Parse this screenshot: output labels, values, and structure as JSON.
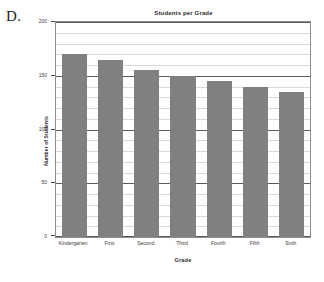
{
  "panel": {
    "letter": "D."
  },
  "chart_data": {
    "type": "bar",
    "title": "Students per Grade",
    "xlabel": "Grade",
    "ylabel": "Number of Students",
    "categories": [
      "Kindergarten",
      "First",
      "Second",
      "Third",
      "Fourth",
      "Fifth",
      "Sixth"
    ],
    "values": [
      170,
      165,
      155,
      150,
      145,
      140,
      135
    ],
    "ylim": [
      0,
      200
    ],
    "ytick_labels": [
      "0",
      "50",
      "100",
      "150",
      "200"
    ],
    "ytick_values": [
      0,
      50,
      100,
      150,
      200
    ],
    "minor_tick_step": 10,
    "grid": true,
    "grid_orientation": "horizontal",
    "legend": false,
    "bar_color": "#808080",
    "grid_color": "#d8d8e4",
    "major_grid_color": "#5a5a5a",
    "frame_color": "#8c8c8c"
  }
}
